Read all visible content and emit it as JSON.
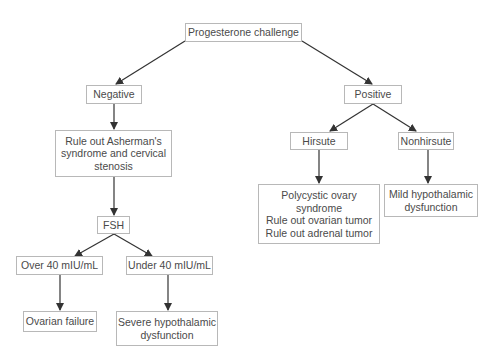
{
  "diagram": {
    "type": "flowchart",
    "nodes": {
      "root": {
        "lines": [
          "Progesterone challenge"
        ]
      },
      "negative": {
        "lines": [
          "Negative"
        ]
      },
      "positive": {
        "lines": [
          "Positive"
        ]
      },
      "asherman": {
        "lines": [
          "Rule out Asherman's",
          "syndrome and cervical",
          "stenosis"
        ]
      },
      "hirsute": {
        "lines": [
          "Hirsute"
        ]
      },
      "nonhirsute": {
        "lines": [
          "Nonhirsute"
        ]
      },
      "fsh": {
        "lines": [
          "FSH"
        ]
      },
      "pcos": {
        "lines": [
          "Polycystic ovary",
          "syndrome",
          "Rule out ovarian tumor",
          "Rule out adrenal tumor"
        ]
      },
      "mild": {
        "lines": [
          "Mild hypothalamic",
          "dysfunction"
        ]
      },
      "over40": {
        "lines": [
          "Over 40 mIU/mL"
        ]
      },
      "under40": {
        "lines": [
          "Under 40 mIU/mL"
        ]
      },
      "ovarian_failure": {
        "lines": [
          "Ovarian failure"
        ]
      },
      "severe": {
        "lines": [
          "Severe hypothalamic",
          "dysfunction"
        ]
      }
    },
    "edges": [
      [
        "root",
        "negative"
      ],
      [
        "root",
        "positive"
      ],
      [
        "negative",
        "asherman"
      ],
      [
        "asherman",
        "fsh"
      ],
      [
        "fsh",
        "over40"
      ],
      [
        "fsh",
        "under40"
      ],
      [
        "over40",
        "ovarian_failure"
      ],
      [
        "under40",
        "severe"
      ],
      [
        "positive",
        "hirsute"
      ],
      [
        "positive",
        "nonhirsute"
      ],
      [
        "hirsute",
        "pcos"
      ],
      [
        "nonhirsute",
        "mild"
      ]
    ],
    "colors": {
      "border": "#b8b8b8",
      "text": "#4a4a4a",
      "arrow": "#333333"
    }
  }
}
